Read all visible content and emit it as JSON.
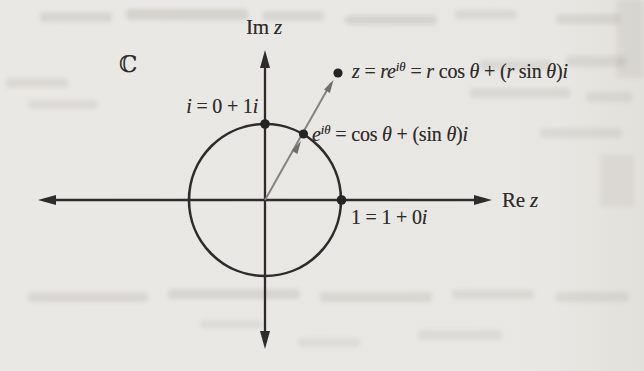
{
  "figure": {
    "colors": {
      "paper": "#e9e7e3",
      "ink": "#2e2c2a",
      "ray": "#85837f",
      "dot": "#252423"
    },
    "axes": {
      "horizontal": {
        "label_parts": [
          {
            "t": "Re",
            "s": "rm"
          },
          {
            "t": " ",
            "s": "rm"
          },
          {
            "t": "z",
            "s": "it"
          }
        ]
      },
      "vertical": {
        "label_parts": [
          {
            "t": "Im",
            "s": "rm"
          },
          {
            "t": " ",
            "s": "rm"
          },
          {
            "t": "z",
            "s": "it"
          }
        ]
      }
    },
    "plane_symbol": {
      "label_parts": [
        {
          "t": "ℂ",
          "s": "bb"
        }
      ]
    },
    "unit_circle": {
      "center": [
        0,
        0
      ],
      "radius": 1
    },
    "ray": {
      "angle_deg": 60,
      "endpoint_modulus": 1.9
    },
    "points": [
      {
        "id": "i",
        "coords": [
          0,
          1
        ],
        "label_parts": [
          {
            "t": "i",
            "s": "it"
          },
          {
            "t": " = 0 + 1",
            "s": "rm"
          },
          {
            "t": "i",
            "s": "it"
          }
        ]
      },
      {
        "id": "one",
        "coords": [
          1,
          0
        ],
        "label_parts": [
          {
            "t": "1 = 1 + 0",
            "s": "rm"
          },
          {
            "t": "i",
            "s": "it"
          }
        ]
      },
      {
        "id": "e-itheta",
        "on_unit_circle": true,
        "angle_deg": 60,
        "label_parts": [
          {
            "t": "e",
            "s": "it"
          },
          {
            "t": "iθ",
            "s": "sup"
          },
          {
            "t": " = cos ",
            "s": "rm"
          },
          {
            "t": "θ",
            "s": "it"
          },
          {
            "t": " + (sin ",
            "s": "rm"
          },
          {
            "t": "θ",
            "s": "it"
          },
          {
            "t": ")",
            "s": "rm"
          },
          {
            "t": "i",
            "s": "it"
          }
        ]
      },
      {
        "id": "z",
        "angle_deg": 60,
        "modulus": "r",
        "label_parts": [
          {
            "t": "z",
            "s": "it"
          },
          {
            "t": " = ",
            "s": "rm"
          },
          {
            "t": "re",
            "s": "it"
          },
          {
            "t": "iθ",
            "s": "sup"
          },
          {
            "t": " = ",
            "s": "rm"
          },
          {
            "t": "r",
            "s": "it"
          },
          {
            "t": " cos ",
            "s": "rm"
          },
          {
            "t": "θ",
            "s": "it"
          },
          {
            "t": " + (",
            "s": "rm"
          },
          {
            "t": "r",
            "s": "it"
          },
          {
            "t": " sin ",
            "s": "rm"
          },
          {
            "t": "θ",
            "s": "it"
          },
          {
            "t": ")",
            "s": "rm"
          },
          {
            "t": "i",
            "s": "it"
          }
        ]
      }
    ]
  }
}
